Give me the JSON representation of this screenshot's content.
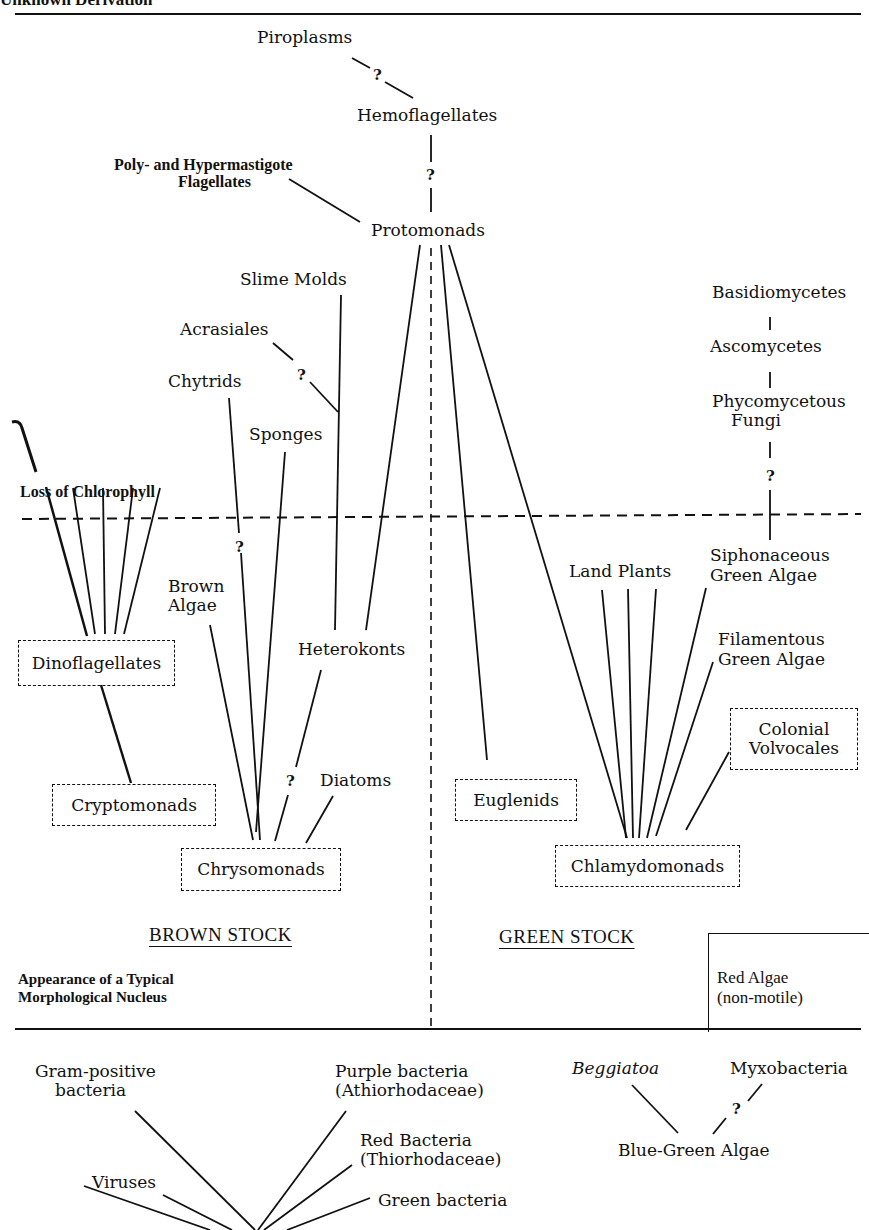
{
  "header": {
    "title_partial": "Unknown Derivation"
  },
  "diagram": {
    "nodes": {
      "piroplasms": "Piroplasms",
      "hemoflagellates": "Hemoflagellates",
      "poly_hyper_1": "Poly- and Hypermastigote",
      "poly_hyper_2": "Flagellates",
      "protomonads": "Protomonads",
      "slime_molds": "Slime Molds",
      "acrasiales": "Acrasiales",
      "chytrids": "Chytrids",
      "sponges": "Sponges",
      "basidiomycetes": "Basidiomycetes",
      "ascomycetes": "Ascomycetes",
      "phycomycetous_1": "Phycomycetous",
      "phycomycetous_2": "Fungi",
      "loss_of_chlorophyll": "Loss of Chlorophyll",
      "brown_algae_1": "Brown",
      "brown_algae_2": "Algae",
      "heterokonts": "Heterokonts",
      "dinoflagellates": "Dinoflagellates",
      "cryptomonads": "Cryptomonads",
      "diatoms": "Diatoms",
      "chrysomonads": "Chrysomonads",
      "land_plants": "Land Plants",
      "siphonaceous_1": "Siphonaceous",
      "siphonaceous_2": "Green Algae",
      "filamentous_1": "Filamentous",
      "filamentous_2": "Green Algae",
      "colonial_1": "Colonial",
      "colonial_2": "Volvocales",
      "euglenids": "Euglenids",
      "chlamydomonads": "Chlamydomonads",
      "red_algae_1": "Red Algae",
      "red_algae_2": "(non-motile)",
      "gram_pos_1": "Gram-positive",
      "gram_pos_2": "bacteria",
      "purple_1": "Purple bacteria",
      "purple_2": "(Athiorhodaceae)",
      "red_bact_1": "Red Bacteria",
      "red_bact_2": "(Thiorhodaceae)",
      "viruses": "Viruses",
      "green_bacteria": "Green bacteria",
      "beggiatoa": "Beggiatoa",
      "myxobacteria": "Myxobacteria",
      "blue_green": "Blue-Green Algae"
    },
    "uncertain_mark": "?",
    "stocks": {
      "brown": "BROWN STOCK",
      "green": "GREEN STOCK"
    },
    "nucleus_1": "Appearance of a Typical",
    "nucleus_2": "Morphological Nucleus"
  }
}
